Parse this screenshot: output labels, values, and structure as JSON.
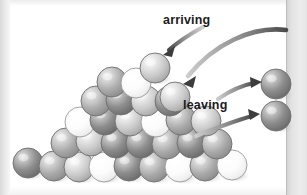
{
  "figure": {
    "title_visible": false,
    "background_color": "#ffffff",
    "page_band_color": "#e2e2e2",
    "labels": {
      "arriving": "arriving",
      "leaving": "leaving"
    }
  },
  "chart_data": {
    "type": "diagram",
    "title": "",
    "subtitle": "",
    "annotations": [
      "arriving",
      "leaving"
    ],
    "legend": [],
    "palette": {
      "sphere_dark": "#8a8a8a",
      "sphere_mid": "#b0b0b0",
      "sphere_light": "#d8d8d8",
      "sphere_white": "#fdfdfd",
      "outline": "#6e6e6e",
      "arrow": "#555555",
      "text": "#1b1b1b"
    },
    "sphere_radius_px": 15,
    "counts": {
      "pile_spheres": 28,
      "arriving_spheres": 2,
      "leaving_spheres": 2,
      "arrows_arriving": 2,
      "arrows_leaving": 2
    },
    "spheres": [
      {
        "group": "pile",
        "x": 28,
        "y": 163,
        "r": 15,
        "tone": "dark"
      },
      {
        "group": "pile",
        "x": 54,
        "y": 166,
        "r": 15,
        "tone": "mid"
      },
      {
        "group": "pile",
        "x": 79,
        "y": 167,
        "r": 15,
        "tone": "light"
      },
      {
        "group": "pile",
        "x": 104,
        "y": 167,
        "r": 15,
        "tone": "white"
      },
      {
        "group": "pile",
        "x": 129,
        "y": 166,
        "r": 15,
        "tone": "dark"
      },
      {
        "group": "pile",
        "x": 154,
        "y": 167,
        "r": 15,
        "tone": "mid"
      },
      {
        "group": "pile",
        "x": 180,
        "y": 167,
        "r": 15,
        "tone": "white"
      },
      {
        "group": "pile",
        "x": 205,
        "y": 166,
        "r": 15,
        "tone": "mid"
      },
      {
        "group": "pile",
        "x": 232,
        "y": 165,
        "r": 15,
        "tone": "white"
      },
      {
        "group": "pile",
        "x": 66,
        "y": 143,
        "r": 15,
        "tone": "mid"
      },
      {
        "group": "pile",
        "x": 91,
        "y": 141,
        "r": 15,
        "tone": "light"
      },
      {
        "group": "pile",
        "x": 116,
        "y": 143,
        "r": 15,
        "tone": "dark"
      },
      {
        "group": "pile",
        "x": 141,
        "y": 143,
        "r": 15,
        "tone": "dark"
      },
      {
        "group": "pile",
        "x": 167,
        "y": 144,
        "r": 15,
        "tone": "mid"
      },
      {
        "group": "pile",
        "x": 192,
        "y": 143,
        "r": 15,
        "tone": "dark"
      },
      {
        "group": "pile",
        "x": 217,
        "y": 144,
        "r": 15,
        "tone": "mid"
      },
      {
        "group": "pile",
        "x": 80,
        "y": 122,
        "r": 15,
        "tone": "white"
      },
      {
        "group": "pile",
        "x": 105,
        "y": 120,
        "r": 15,
        "tone": "dark"
      },
      {
        "group": "pile",
        "x": 130,
        "y": 121,
        "r": 15,
        "tone": "light"
      },
      {
        "group": "pile",
        "x": 156,
        "y": 122,
        "r": 15,
        "tone": "white"
      },
      {
        "group": "pile",
        "x": 181,
        "y": 120,
        "r": 15,
        "tone": "mid"
      },
      {
        "group": "pile",
        "x": 206,
        "y": 121,
        "r": 15,
        "tone": "light"
      },
      {
        "group": "pile",
        "x": 96,
        "y": 101,
        "r": 15,
        "tone": "mid"
      },
      {
        "group": "pile",
        "x": 121,
        "y": 100,
        "r": 15,
        "tone": "dark"
      },
      {
        "group": "pile",
        "x": 146,
        "y": 101,
        "r": 15,
        "tone": "light"
      },
      {
        "group": "pile",
        "x": 170,
        "y": 101,
        "r": 15,
        "tone": "dark"
      },
      {
        "group": "pile",
        "x": 112,
        "y": 82,
        "r": 15,
        "tone": "mid"
      },
      {
        "group": "pile",
        "x": 136,
        "y": 83,
        "r": 15,
        "tone": "white"
      },
      {
        "group": "arriving",
        "x": 155,
        "y": 68,
        "r": 15,
        "tone": "light"
      },
      {
        "group": "arriving",
        "x": 175,
        "y": 97,
        "r": 15,
        "tone": "light"
      },
      {
        "group": "leaving",
        "x": 276,
        "y": 84,
        "r": 15,
        "tone": "dark"
      },
      {
        "group": "leaving",
        "x": 276,
        "y": 116,
        "r": 15,
        "tone": "dark"
      }
    ],
    "arrows": [
      {
        "name": "arriving-short",
        "label": "arriving",
        "from": [
          201,
          26
        ],
        "to": [
          160,
          52
        ],
        "head": "to"
      },
      {
        "name": "arriving-long",
        "label": "arriving",
        "from": [
          285,
          29
        ],
        "to": [
          181,
          84
        ],
        "head": "to"
      },
      {
        "name": "leaving-upper",
        "label": "leaving",
        "from": [
          222,
          95
        ],
        "to": [
          260,
          82
        ],
        "head": "to"
      },
      {
        "name": "leaving-lower",
        "label": "leaving",
        "from": [
          200,
          134
        ],
        "to": [
          258,
          114
        ],
        "head": "to"
      }
    ]
  }
}
